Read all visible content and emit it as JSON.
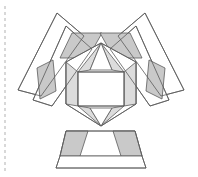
{
  "canvas": {
    "width": 198,
    "height": 177,
    "background": "#ffffff",
    "title": "Geometric polyhedral net figure"
  },
  "style": {
    "stroke_color": "#5a5a5a",
    "stroke_width": 0.8,
    "fill_white": "#ffffff",
    "fill_gray": "#c9c9c9",
    "fill_gray_light": "#dcdcdc",
    "fold_line_color": "#b9b9b9",
    "fold_line_dash": "3 3"
  },
  "guides": {
    "fold_line": {
      "label": "vertical-dashed-fold-line",
      "x": 5,
      "y1": 6,
      "y2": 172
    }
  },
  "shapes": {
    "left_wing": {
      "label": "left-wing-band",
      "outer_white_strip": "57,13 84,36 41,96 18,90",
      "inner_white_strip": "66,26 92,49 52,106 33,100",
      "gray_parallelogram_upper": "72,33 102,33 88,58 60,58",
      "gray_diamond_lower": "37,68 53,60 56,91 40,99"
    },
    "right_wing": {
      "label": "right-wing-band",
      "outer_white_strip": "145,13 118,36 161,96 184,90",
      "inner_white_strip": "136,26 110,49 150,106 169,100",
      "gray_parallelogram_upper": "130,33 100,33 114,58 142,58",
      "gray_diamond_lower": "165,68 149,60 146,91 162,99"
    },
    "core": {
      "label": "central-hexagonal-core",
      "hex_outer": "101,43 136,62 136,104 101,126 66,104 66,62",
      "box_top_left": "78,72 101,57 101,72",
      "box_top_right": "124,72 101,57 101,72",
      "box_rect": "78,72 124,72 124,106 78,106",
      "box_bottom_left": "78,106 101,121 101,106",
      "box_bottom_right": "124,106 101,121 101,106",
      "left_facet": "66,62 78,72 78,106 66,104",
      "right_facet": "136,62 124,72 124,106 136,104",
      "apex_left_gray": "101,43 78,72 89,69",
      "apex_right_gray": "101,43 124,72 113,69",
      "base_left_gray": "101,126 78,106 89,109",
      "base_right_gray": "101,126 124,106 113,109"
    },
    "pedestal": {
      "label": "bottom-trapezoid-pedestal",
      "upper_band": "66,131 135,131 142,156 60,156",
      "gray_left": "66,131 88,131 80,156 60,156",
      "gray_right": "135,131 113,131 121,156 142,156",
      "lower_trapezoid": "60,156 142,156 146,168 56,168"
    }
  },
  "elements": {
    "fold_line_name": "fold-line",
    "figure_name": "geometric-figure"
  }
}
